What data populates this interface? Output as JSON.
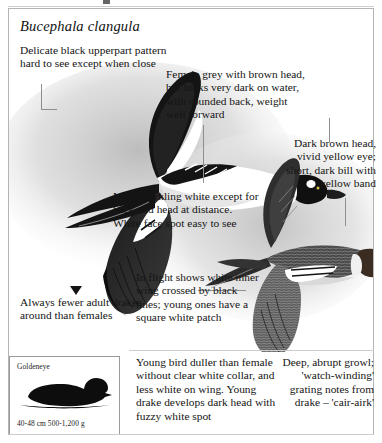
{
  "page": {
    "scientific_name": "Bucephala clangula"
  },
  "notes": {
    "upperpart_pattern": "Delicate black upperpart pattern hard to see except when close",
    "female_plumage": "Female grey with brown head, but looks very dark on water, with rounded back, weight well forward",
    "head_and_bill": "Dark brown head, vivid yellow eye; short, dark bill with yellow band",
    "male_plumage": "Male sparkling white except for back and head at distance. White face spot easy to see",
    "in_flight": "In flight shows white inner wing crossed by black lines; young ones have a square white patch",
    "drakes_ratio": "Always fewer adult drakes around than females",
    "young_bird": "Young bird duller than female without clear white collar, and less white on wing. Young drake develops dark head with fuzzy white spot",
    "voice": "Deep, abrupt growl; 'watch-winding' grating notes from drake – 'cair-airk'"
  },
  "inset": {
    "species_label": "Goldeneye",
    "measurements": "40-48 cm  500-1,200 g"
  },
  "colors": {
    "ink": "#141414",
    "frame": "#b4b4b4",
    "leader": "#8e8e8e",
    "wash": "#c9c9c9"
  }
}
